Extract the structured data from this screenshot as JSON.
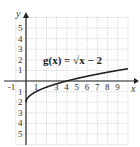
{
  "chart_data": {
    "type": "line",
    "title": "",
    "annotation": "g(x) = √x − 2",
    "xlabel": "x",
    "ylabel": "y",
    "xlim": [
      -1,
      10
    ],
    "ylim": [
      -6,
      6
    ],
    "grid": true,
    "x_ticks": [
      "-1",
      "1",
      "3",
      "4",
      "5",
      "6",
      "7",
      "8",
      "9"
    ],
    "y_ticks": [
      "5",
      "4",
      "3",
      "2",
      "1",
      "-1",
      "-2",
      "-3",
      "-4",
      "-5"
    ],
    "series": [
      {
        "name": "g(x) = √x − 2",
        "x": [
          0,
          0.25,
          1,
          2,
          3,
          4,
          5,
          6,
          7,
          8,
          9,
          10
        ],
        "y": [
          -2,
          -1.5,
          -1,
          -0.59,
          -0.27,
          0,
          0.24,
          0.45,
          0.65,
          0.83,
          1,
          1.16
        ]
      }
    ],
    "color": "#222222"
  },
  "labels": {
    "equation": "g(x) = √x − 2",
    "x_axis": "x",
    "y_axis": "y"
  }
}
